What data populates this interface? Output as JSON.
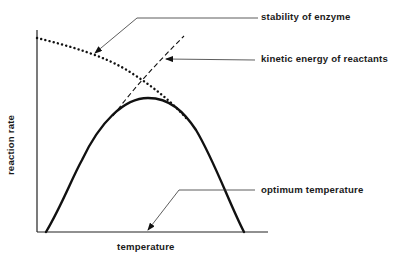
{
  "diagram": {
    "title": "",
    "axes": {
      "x_label": "temperature",
      "y_label": "reaction rate"
    },
    "curves": [
      {
        "name": "reaction-rate-curve",
        "style": "solid-thick",
        "shape": "bell",
        "peak_label": "optimum temperature"
      },
      {
        "name": "stability-of-enzyme",
        "style": "dotted",
        "trend": "decreasing"
      },
      {
        "name": "kinetic-energy-of-reactants",
        "style": "dashed",
        "trend": "increasing"
      }
    ],
    "labels": {
      "stability": "stability of enzyme",
      "kinetic": "kinetic energy of reactants",
      "optimum": "optimum temperature"
    },
    "colors": {
      "ink": "#111111",
      "background": "#ffffff"
    }
  }
}
